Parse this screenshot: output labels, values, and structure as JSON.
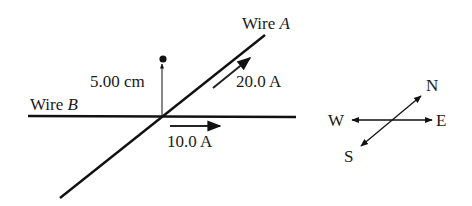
{
  "diagram": {
    "wire_a": {
      "label": "Wire ",
      "letter": "A",
      "current": "20.0 A"
    },
    "wire_b": {
      "label": "Wire ",
      "letter": "B",
      "current": "10.0 A"
    },
    "distance_label": "5.00 cm",
    "compass": {
      "north": "N",
      "south": "S",
      "east": "E",
      "west": "W"
    },
    "colors": {
      "line": "#111111",
      "background": "#ffffff"
    }
  }
}
